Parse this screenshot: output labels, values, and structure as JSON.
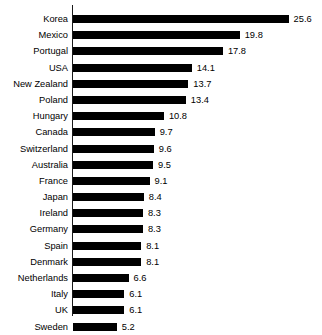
{
  "chart_data": {
    "type": "bar",
    "orientation": "horizontal",
    "title": "",
    "subtitle": "",
    "xlabel": "",
    "ylabel": "",
    "grid": false,
    "legend": null,
    "legend_position": "none",
    "axis_ticks": false,
    "xlim": [
      0,
      25.6
    ],
    "value_labels_shown": true,
    "bar_color": "#000000",
    "background_color": "#ffffff",
    "axis_color": "#1a1a1a",
    "text_color": "#000000",
    "categories": [
      "Korea",
      "Mexico",
      "Portugal",
      "USA",
      "New Zealand",
      "Poland",
      "Hungary",
      "Canada",
      "Switzerland",
      "Australia",
      "France",
      "Japan",
      "Ireland",
      "Germany",
      "Spain",
      "Denmark",
      "Netherlands",
      "Italy",
      "UK",
      "Sweden"
    ],
    "values": [
      25.6,
      19.8,
      17.8,
      14.1,
      13.7,
      13.4,
      10.8,
      9.7,
      9.6,
      9.5,
      9.1,
      8.4,
      8.3,
      8.3,
      8.1,
      8.1,
      6.6,
      6.1,
      6.1,
      5.2
    ],
    "value_labels": [
      "25.6",
      "19.8",
      "17.8",
      "14.1",
      "13.7",
      "13.4",
      "10.8",
      "9.7",
      "9.6",
      "9.5",
      "9.1",
      "8.4",
      "8.3",
      "8.3",
      "8.1",
      "8.1",
      "6.6",
      "6.1",
      "6.1",
      "5.2"
    ],
    "rows": [
      {
        "category": "Korea",
        "value": 25.6,
        "label": "25.6"
      },
      {
        "category": "Mexico",
        "value": 19.8,
        "label": "19.8"
      },
      {
        "category": "Portugal",
        "value": 17.8,
        "label": "17.8"
      },
      {
        "category": "USA",
        "value": 14.1,
        "label": "14.1"
      },
      {
        "category": "New Zealand",
        "value": 13.7,
        "label": "13.7"
      },
      {
        "category": "Poland",
        "value": 13.4,
        "label": "13.4"
      },
      {
        "category": "Hungary",
        "value": 10.8,
        "label": "10.8"
      },
      {
        "category": "Canada",
        "value": 9.7,
        "label": "9.7"
      },
      {
        "category": "Switzerland",
        "value": 9.6,
        "label": "9.6"
      },
      {
        "category": "Australia",
        "value": 9.5,
        "label": "9.5"
      },
      {
        "category": "France",
        "value": 9.1,
        "label": "9.1"
      },
      {
        "category": "Japan",
        "value": 8.4,
        "label": "8.4"
      },
      {
        "category": "Ireland",
        "value": 8.3,
        "label": "8.3"
      },
      {
        "category": "Germany",
        "value": 8.3,
        "label": "8.3"
      },
      {
        "category": "Spain",
        "value": 8.1,
        "label": "8.1"
      },
      {
        "category": "Denmark",
        "value": 8.1,
        "label": "8.1"
      },
      {
        "category": "Netherlands",
        "value": 6.6,
        "label": "6.6"
      },
      {
        "category": "Italy",
        "value": 6.1,
        "label": "6.1"
      },
      {
        "category": "UK",
        "value": 6.1,
        "label": "6.1"
      },
      {
        "category": "Sweden",
        "value": 5.2,
        "label": "5.2"
      }
    ]
  },
  "layout": {
    "px_per_unit": 8.42,
    "bar_origin_x": 73,
    "row_pitch": 16.2,
    "bar_height": 8,
    "value_gap": 5
  }
}
